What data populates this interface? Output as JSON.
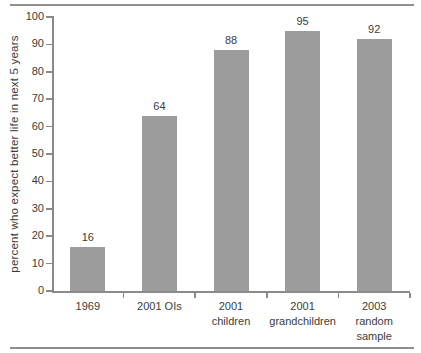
{
  "figure": {
    "background": "#ffffff",
    "top_rule": true,
    "bottom_rule": true
  },
  "colors": {
    "bar": "#9c9c9c",
    "axis": "#8a8a8a",
    "text": "#3c3c38",
    "rule": "#8f8f8f"
  },
  "chart_data": {
    "type": "bar",
    "categories": [
      "1969",
      "2001 OIs",
      "2001\nchildren",
      "2001\ngrandchildren",
      "2003\nrandom\nsample"
    ],
    "values": [
      16,
      64,
      88,
      95,
      92
    ],
    "data_labels": [
      "16",
      "64",
      "88",
      "95",
      "92"
    ],
    "title": "",
    "xlabel": "",
    "ylabel": "percent who expect better life in next 5 years",
    "ylim": [
      0,
      100
    ],
    "yticks": [
      0,
      10,
      20,
      30,
      40,
      50,
      60,
      70,
      80,
      90,
      100
    ],
    "grid": false,
    "legend": "none",
    "data_labels_shown": true
  }
}
